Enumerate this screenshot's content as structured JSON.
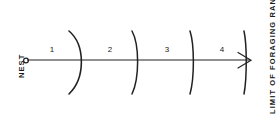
{
  "figure": {
    "nest_label": "NEST",
    "limit_label": "LIMIT OF FORAGING RANGE",
    "line_color": "#222222",
    "background_color": "#ffffff",
    "segments": [
      {
        "label": "1",
        "x": 52,
        "y": 54
      },
      {
        "label": "2",
        "x": 110,
        "y": 54
      },
      {
        "label": "3",
        "x": 167,
        "y": 54
      },
      {
        "label": "4",
        "x": 222,
        "y": 54
      }
    ],
    "arcs": [
      {
        "name": "arc-1",
        "x": 80,
        "bulge": 11
      },
      {
        "name": "arc-2",
        "x": 137,
        "bulge": 5
      },
      {
        "name": "arc-3",
        "x": 193,
        "bulge": 3
      },
      {
        "name": "arc-4",
        "x": 246,
        "bulge": 2
      }
    ],
    "axis": {
      "x_start": 27,
      "x_end": 250,
      "y": 60,
      "origin_marker": "open-circle",
      "end_marker": "arrowhead"
    }
  }
}
